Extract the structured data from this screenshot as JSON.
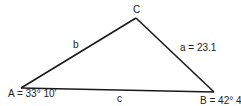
{
  "diagram": {
    "type": "triangle",
    "vertices": {
      "A": {
        "label": "A = 33° 10′"
      },
      "B": {
        "label": "B = 42° 40′"
      },
      "C": {
        "label": "C"
      }
    },
    "sides": {
      "a": {
        "label": "a = 23.1"
      },
      "b": {
        "label": "b"
      },
      "c": {
        "label": "c"
      }
    },
    "stroke_color": "#1a1a1a"
  }
}
